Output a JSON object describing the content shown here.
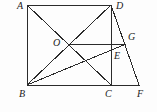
{
  "figure": {
    "kind": "geometry-diagram",
    "stroke_color": "#2b2b2b",
    "background_color": "#fdfdfd",
    "width": 157,
    "height": 112
  },
  "points": [
    {
      "id": "A",
      "label": "A",
      "x": 27,
      "y": 5,
      "label_x": 17,
      "label_y": 1
    },
    {
      "id": "D",
      "label": "D",
      "x": 111,
      "y": 5,
      "label_x": 116,
      "label_y": 1
    },
    {
      "id": "B",
      "label": "B",
      "x": 27,
      "y": 85,
      "label_x": 19,
      "label_y": 89
    },
    {
      "id": "C",
      "label": "C",
      "x": 111,
      "y": 85,
      "label_x": 105,
      "label_y": 89
    },
    {
      "id": "F",
      "label": "F",
      "x": 139,
      "y": 85,
      "label_x": 137,
      "label_y": 89
    },
    {
      "id": "O",
      "label": "O",
      "x": 69,
      "y": 45,
      "label_x": 53,
      "label_y": 38
    },
    {
      "id": "G",
      "label": "G",
      "x": 126,
      "y": 44,
      "label_x": 128,
      "label_y": 32
    },
    {
      "id": "E",
      "label": "E",
      "x": 111,
      "y": 58,
      "label_x": 114,
      "label_y": 51
    }
  ],
  "segments": [
    {
      "id": "AD",
      "from": "A",
      "to": "D",
      "note": "top side of rectangle"
    },
    {
      "id": "AB",
      "from": "A",
      "to": "B",
      "note": "left side of rectangle"
    },
    {
      "id": "BF",
      "from": "B",
      "to": "F",
      "note": "bottom baseline through C"
    },
    {
      "id": "DC",
      "from": "D",
      "to": "C",
      "note": "vertical right side of rectangle"
    },
    {
      "id": "AC",
      "from": "A",
      "to": "C",
      "note": "diagonal"
    },
    {
      "id": "BD",
      "from": "B",
      "to": "D",
      "note": "diagonal"
    },
    {
      "id": "DF",
      "from": "D",
      "to": "F",
      "note": "slanted side through G"
    },
    {
      "id": "OG",
      "from": "O",
      "to": "G",
      "note": "horizontal segment"
    },
    {
      "id": "BG",
      "from": "B",
      "to": "G",
      "note": "crosses DC at E"
    }
  ]
}
